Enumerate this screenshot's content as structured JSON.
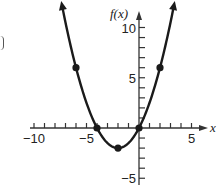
{
  "chart_data": {
    "type": "line",
    "title": "",
    "function": "f(x) = 0.5x^2 + 2x",
    "xlabel": "x",
    "ylabel": "f(x)",
    "xlim": [
      -10,
      6
    ],
    "ylim": [
      -5,
      11
    ],
    "x_tick_labels": [
      "-10",
      "-5",
      "5"
    ],
    "x_tick_values": [
      -10,
      -5,
      5
    ],
    "y_tick_labels": [
      "10",
      "5",
      "-5"
    ],
    "y_tick_values": [
      10,
      5,
      -5
    ],
    "minor_tick_step": 1,
    "grid": false,
    "legend": null,
    "points": [
      {
        "x": -6,
        "y": 6
      },
      {
        "x": -4,
        "y": 0
      },
      {
        "x": -2,
        "y": -2
      },
      {
        "x": 0,
        "y": 0
      },
      {
        "x": 2,
        "y": 6
      }
    ],
    "curve_x_range": [
      -7.3,
      3.3
    ],
    "arrows_at_ends": true
  },
  "colors": {
    "line": "#1a1a1a",
    "axis": "#333333",
    "background": "#ffffff"
  }
}
